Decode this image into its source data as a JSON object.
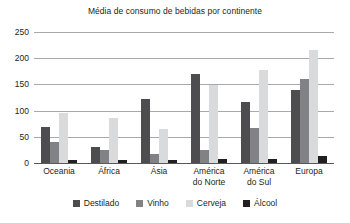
{
  "chart_data": {
    "type": "bar",
    "title": "Média de consumo de bebidas por continente",
    "xlabel": "",
    "ylabel": "",
    "ylim": [
      0,
      250
    ],
    "yticks": [
      0,
      50,
      100,
      150,
      200,
      250
    ],
    "grid": true,
    "legend_position": "bottom",
    "categories": [
      "Oceania",
      "África",
      "Ásia",
      "América do Norte",
      "América do Sul",
      "Europa"
    ],
    "category_lines": [
      {
        "l1": "Oceania",
        "l2": ""
      },
      {
        "l1": "África",
        "l2": ""
      },
      {
        "l1": "Ásia",
        "l2": ""
      },
      {
        "l1": "América",
        "l2": "do Norte"
      },
      {
        "l1": "América",
        "l2": "do Sul"
      },
      {
        "l1": "Europa",
        "l2": ""
      }
    ],
    "series": [
      {
        "name": "Destilado",
        "color": "#4d4d4f",
        "values": [
          68,
          30,
          123,
          170,
          117,
          140
        ]
      },
      {
        "name": "Vinho",
        "color": "#808285",
        "values": [
          40,
          25,
          18,
          25,
          67,
          160
        ]
      },
      {
        "name": "Cerveja",
        "color": "#d9dadb",
        "values": [
          96,
          85,
          65,
          148,
          178,
          215
        ]
      },
      {
        "name": "Álcool",
        "color": "#221f1f",
        "values": [
          5,
          5,
          5,
          7,
          8,
          13
        ]
      }
    ]
  }
}
